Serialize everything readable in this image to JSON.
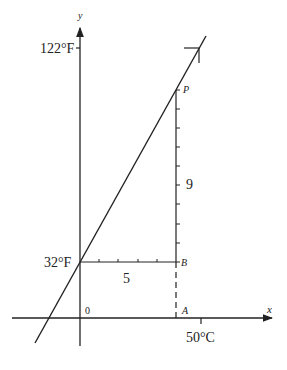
{
  "diagram": {
    "axes": {
      "x_label": "x",
      "y_label": "y",
      "origin_label": "0"
    },
    "labels": {
      "f122": "122°F",
      "f32": "32°F",
      "c50": "50°C",
      "point_p": "P",
      "point_b": "B",
      "point_a": "A",
      "run_count": "5",
      "rise_count": "9"
    },
    "slope_triangle": {
      "run": 5,
      "rise": 9,
      "run_ticks": 5,
      "rise_ticks": 9
    },
    "colors": {
      "ink": "#222222",
      "background": "#ffffff"
    }
  }
}
